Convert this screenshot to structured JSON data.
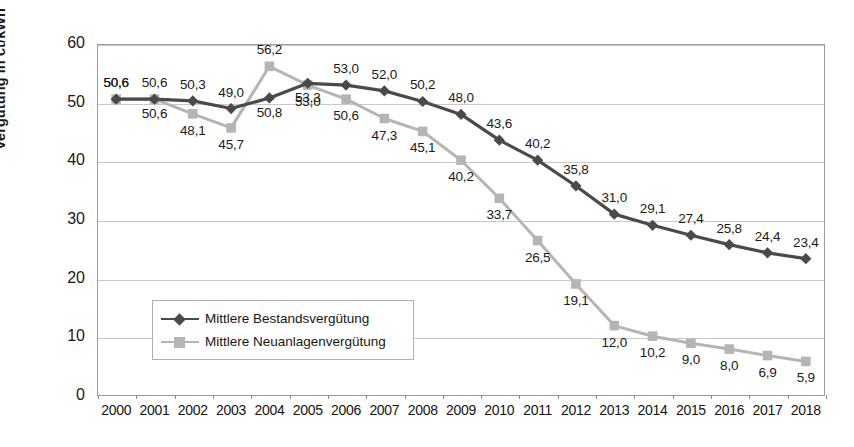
{
  "chart_data": {
    "type": "line",
    "title": "",
    "xlabel": "",
    "ylabel": "Vergütung in ct/kWh",
    "ylim": [
      0,
      60
    ],
    "yticks": [
      0,
      10,
      20,
      30,
      40,
      50,
      60
    ],
    "grid": true,
    "legend_position": "inside-lower-left",
    "decimal_separator": ",",
    "categories": [
      "2000",
      "2001",
      "2002",
      "2003",
      "2004",
      "2005",
      "2006",
      "2007",
      "2008",
      "2009",
      "2010",
      "2011",
      "2012",
      "2013",
      "2014",
      "2015",
      "2016",
      "2017",
      "2018"
    ],
    "series": [
      {
        "name": "Mittlere Bestandsvergütung",
        "color": "#4a4a4a",
        "marker": "diamond",
        "values": [
          50.6,
          50.6,
          50.3,
          49.0,
          50.8,
          53.3,
          53.0,
          52.0,
          50.2,
          48.0,
          43.6,
          40.2,
          35.8,
          31.0,
          29.1,
          27.4,
          25.8,
          24.4,
          23.4
        ],
        "labels": [
          "50,6",
          "50,6",
          "50,3",
          "49,0",
          "50,8",
          "53,3",
          "53,0",
          "52,0",
          "50,2",
          "48,0",
          "43,6",
          "40,2",
          "35,8",
          "31,0",
          "29,1",
          "27,4",
          "25,8",
          "24,4",
          "23,4"
        ]
      },
      {
        "name": "Mittlere Neuanlagenvergütung",
        "color": "#b5b5b5",
        "marker": "square",
        "values": [
          50.6,
          50.6,
          48.1,
          45.7,
          56.2,
          53.0,
          50.6,
          47.3,
          45.1,
          40.2,
          33.7,
          26.5,
          19.1,
          12.0,
          10.2,
          9.0,
          8.0,
          6.9,
          5.9
        ],
        "labels": [
          "50,6",
          "50,6",
          "48,1",
          "45,7",
          "56,2",
          "53,0",
          "50,6",
          "47,3",
          "45,1",
          "40,2",
          "33,7",
          "26,5",
          "19,1",
          "12,0",
          "10,2",
          "9,0",
          "8,0",
          "6,9",
          "5,9"
        ]
      }
    ]
  },
  "axis": {
    "y_label": "Vergütung in ct/kWh",
    "y_tick_labels": [
      "60",
      "50",
      "40",
      "30",
      "20",
      "10",
      "0"
    ],
    "x_tick_labels": [
      "2000",
      "2001",
      "2002",
      "2003",
      "2004",
      "2005",
      "2006",
      "2007",
      "2008",
      "2009",
      "2010",
      "2011",
      "2012",
      "2013",
      "2014",
      "2015",
      "2016",
      "2017",
      "2018"
    ]
  },
  "legend": {
    "items": [
      {
        "label": "Mittlere Bestandsvergütung",
        "color": "#4a4a4a",
        "marker": "diamond"
      },
      {
        "label": "Mittlere Neuanlagenvergütung",
        "color": "#b5b5b5",
        "marker": "square"
      }
    ]
  },
  "colors": {
    "bestand": "#4a4a4a",
    "neuanlagen": "#b5b5b5",
    "grid": "#c9c9c9",
    "frame": "#9a9a9a",
    "text": "#1a1a1a",
    "background": "#ffffff"
  }
}
